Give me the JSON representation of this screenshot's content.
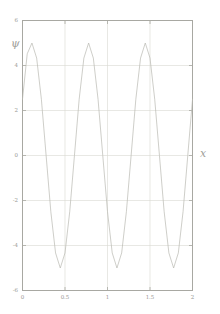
{
  "chart_data": {
    "type": "line",
    "title": "",
    "subtitle": "",
    "xlabel": "x",
    "ylabel": "ψ",
    "xlim": [
      0,
      2
    ],
    "ylim": [
      -6,
      6
    ],
    "grid": true,
    "legend": null,
    "legend_position": "none",
    "xticks": [
      0,
      0.5,
      1,
      1.5,
      2
    ],
    "xtick_labels": [
      "0",
      "0.5",
      "1",
      "1.5",
      "2"
    ],
    "yticks": [
      -6,
      -4,
      -2,
      0,
      2,
      4,
      6
    ],
    "ytick_labels": [
      "-6",
      "-4",
      "-2",
      "0",
      "2",
      "4",
      "6"
    ],
    "series": [
      {
        "name": "psi",
        "expression": "5*sin(3*pi*x + pi/6)",
        "amplitude": 5,
        "periods": 3,
        "color": "#b9b9b2",
        "linewidth": 0.7,
        "points": [
          {
            "x": 0.0,
            "y": 2.5
          },
          {
            "x": 0.0556,
            "y": 4.52
          },
          {
            "x": 0.1111,
            "y": 5.0
          },
          {
            "x": 0.1667,
            "y": 4.33
          },
          {
            "x": 0.2222,
            "y": 2.5
          },
          {
            "x": 0.2778,
            "y": 0.0
          },
          {
            "x": 0.3333,
            "y": -2.5
          },
          {
            "x": 0.3889,
            "y": -4.33
          },
          {
            "x": 0.4444,
            "y": -5.0
          },
          {
            "x": 0.5,
            "y": -4.33
          },
          {
            "x": 0.5556,
            "y": -2.5
          },
          {
            "x": 0.6111,
            "y": 0.0
          },
          {
            "x": 0.6667,
            "y": 2.5
          },
          {
            "x": 0.7222,
            "y": 4.33
          },
          {
            "x": 0.7778,
            "y": 5.0
          },
          {
            "x": 0.8333,
            "y": 4.33
          },
          {
            "x": 0.8889,
            "y": 2.5
          },
          {
            "x": 0.9444,
            "y": 0.0
          },
          {
            "x": 1.0,
            "y": -2.5
          },
          {
            "x": 1.0556,
            "y": -4.33
          },
          {
            "x": 1.1111,
            "y": -5.0
          },
          {
            "x": 1.1667,
            "y": -4.33
          },
          {
            "x": 1.2222,
            "y": -2.5
          },
          {
            "x": 1.2778,
            "y": 0.0
          },
          {
            "x": 1.3333,
            "y": 2.5
          },
          {
            "x": 1.3889,
            "y": 4.33
          },
          {
            "x": 1.4444,
            "y": 5.0
          },
          {
            "x": 1.5,
            "y": 4.33
          },
          {
            "x": 1.5556,
            "y": 2.5
          },
          {
            "x": 1.6111,
            "y": 0.0
          },
          {
            "x": 1.6667,
            "y": -2.5
          },
          {
            "x": 1.7222,
            "y": -4.33
          },
          {
            "x": 1.7778,
            "y": -5.0
          },
          {
            "x": 1.8333,
            "y": -4.33
          },
          {
            "x": 1.8889,
            "y": -2.5
          },
          {
            "x": 1.9444,
            "y": 0.0
          },
          {
            "x": 2.0,
            "y": 2.5
          }
        ]
      }
    ]
  },
  "style": {
    "background": "#ffffff",
    "frame_color": "#a8a8a2",
    "grid_color": "#d8d8d2",
    "tick_color": "#a8a8a2",
    "label_color": "#9a9a95",
    "curve_color": "#b9b9b2"
  },
  "axes": {
    "y_axis_title": "ψ",
    "x_axis_title": "x"
  }
}
